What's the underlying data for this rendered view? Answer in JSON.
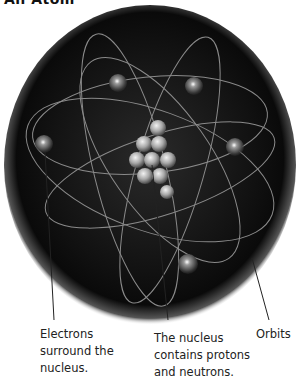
{
  "title": "An Atom",
  "labels": {
    "electrons": "Electrons surround the nucleus.",
    "nucleus": "The nucleus contains protons and neutrons.",
    "orbits": "Orbits"
  },
  "colors": {
    "background": "#ffffff",
    "sphere": "#111111",
    "orbit": "#8a8a8a",
    "particle": "#bdbdbd",
    "text": "#222222"
  }
}
